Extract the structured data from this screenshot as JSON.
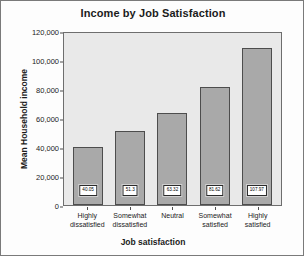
{
  "chart_data": {
    "type": "bar",
    "title": "Income by Job Satisfaction",
    "xlabel": "Job satisfaction",
    "ylabel": "Mean Household income",
    "categories": [
      "Highly dissatisfied",
      "Somewhat dissatisfied",
      "Neutral",
      "Somewhat satisfied",
      "Highly satisfied"
    ],
    "category_lines": [
      [
        "Highly",
        "dissatisfied"
      ],
      [
        "Somewhat",
        "dissatisfied"
      ],
      [
        "Neutral",
        ""
      ],
      [
        "Somewhat",
        "satisfied"
      ],
      [
        "Highly",
        "satisfied"
      ]
    ],
    "values": [
      40050,
      51300,
      63320,
      81620,
      107970
    ],
    "data_labels": [
      "40.05",
      "51.3",
      "63.32",
      "81.62",
      "107.97"
    ],
    "data_label_units": "thousands",
    "ylim": [
      0,
      120000
    ],
    "ytick_labels": [
      "120,000",
      "100,000",
      "80,000",
      "60,000",
      "40,000",
      "20,000",
      "0"
    ],
    "ytick_values": [
      120000,
      100000,
      80000,
      60000,
      40000,
      20000,
      0
    ],
    "grid": false,
    "legend": false,
    "colors": {
      "bar_fill": "#a9a9a9",
      "bar_border": "#4d4d4d",
      "plot_background": "#e9e9e9",
      "figure_background": "#fdfdfd",
      "axis": "#4d4d4d",
      "text": "#1b1b1b",
      "label_box_fill": "#ffffff",
      "label_box_border": "#2b2b2b"
    }
  }
}
